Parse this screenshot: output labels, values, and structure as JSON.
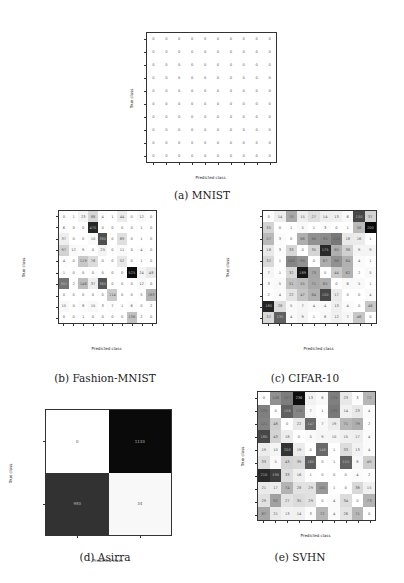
{
  "figure": {
    "captions": {
      "a": "(a) MNIST",
      "b": "(b) Fashion-MNIST",
      "c": "(c) CIFAR-10",
      "d": "(d) Asirra",
      "e": "(e) SVHN"
    }
  },
  "chart_data": [
    {
      "id": "mnist",
      "type": "heatmap",
      "title": "(a) MNIST",
      "xlabel": "Predicted class",
      "ylabel": "True class",
      "x_categories": [
        "0",
        "1",
        "2",
        "3",
        "4",
        "5",
        "6",
        "7",
        "8",
        "9"
      ],
      "y_categories": [
        "0",
        "1",
        "2",
        "3",
        "4",
        "5",
        "6",
        "7",
        "8",
        "9"
      ],
      "values": [
        [
          0,
          0,
          0,
          0,
          0,
          0,
          0,
          0,
          0,
          0
        ],
        [
          0,
          0,
          0,
          0,
          0,
          0,
          0,
          0,
          0,
          0
        ],
        [
          0,
          0,
          0,
          0,
          0,
          0,
          0,
          0,
          0,
          0
        ],
        [
          0,
          0,
          0,
          0,
          0,
          0,
          0,
          0,
          0,
          0
        ],
        [
          0,
          0,
          0,
          0,
          0,
          0,
          0,
          0,
          0,
          0
        ],
        [
          0,
          0,
          0,
          0,
          0,
          0,
          0,
          0,
          0,
          0
        ],
        [
          0,
          0,
          0,
          0,
          0,
          0,
          0,
          0,
          0,
          0
        ],
        [
          0,
          0,
          0,
          0,
          0,
          0,
          0,
          0,
          0,
          0
        ],
        [
          0,
          0,
          0,
          0,
          0,
          0,
          0,
          0,
          0,
          0
        ],
        [
          0,
          0,
          0,
          0,
          0,
          0,
          0,
          0,
          0,
          0
        ]
      ],
      "colormap": "greys",
      "vmax": 1
    },
    {
      "id": "fashion_mnist",
      "type": "heatmap",
      "title": "(b) Fashion-MNIST",
      "xlabel": "Predicted class",
      "ylabel": "True class",
      "x_categories": [
        "T-shirt/top",
        "trouser",
        "pullover",
        "dress",
        "coat",
        "sandal",
        "shirt",
        "sneaker",
        "bag",
        "ankle boot"
      ],
      "y_categories": [
        "T-shirt/top",
        "trouser",
        "pullover",
        "dress",
        "coat",
        "sandal",
        "shirt",
        "sneaker",
        "bag",
        "ankle boot"
      ],
      "values": [
        [
          0,
          1,
          23,
          88,
          4,
          1,
          44,
          0,
          12,
          0
        ],
        [
          6,
          0,
          0,
          470,
          0,
          0,
          0,
          0,
          1,
          0
        ],
        [
          37,
          0,
          0,
          10,
          380,
          0,
          69,
          0,
          1,
          0
        ],
        [
          97,
          12,
          9,
          0,
          25,
          0,
          11,
          0,
          4,
          0
        ],
        [
          4,
          0,
          119,
          76,
          0,
          0,
          52,
          0,
          1,
          0
        ],
        [
          1,
          0,
          0,
          0,
          0,
          0,
          0,
          525,
          24,
          48
        ],
        [
          301,
          2,
          146,
          37,
          365,
          0,
          0,
          0,
          12,
          0
        ],
        [
          0,
          0,
          0,
          0,
          0,
          114,
          0,
          0,
          5,
          163
        ],
        [
          15,
          0,
          8,
          15,
          3,
          7,
          1,
          6,
          0,
          2
        ],
        [
          0,
          0,
          1,
          0,
          0,
          0,
          0,
          136,
          2,
          0
        ]
      ],
      "colormap": "greys",
      "vmax": 530
    },
    {
      "id": "cifar10",
      "type": "heatmap",
      "title": "(c) CIFAR-10",
      "xlabel": "Predicted class",
      "ylabel": "True class",
      "x_categories": [
        "airplane",
        "automobile",
        "bird",
        "cat",
        "deer",
        "dog",
        "frog",
        "horse",
        "ship",
        "truck"
      ],
      "y_categories": [
        "airplane",
        "automobile",
        "bird",
        "cat",
        "deer",
        "dog",
        "frog",
        "horse",
        "ship",
        "truck"
      ],
      "values": [
        [
          0,
          14,
          70,
          15,
          27,
          14,
          13,
          6,
          150,
          37
        ],
        [
          35,
          0,
          1,
          5,
          1,
          3,
          0,
          1,
          56,
          200
        ],
        [
          57,
          3,
          0,
          66,
          90,
          95,
          110,
          18,
          16,
          1
        ],
        [
          18,
          3,
          33,
          0,
          35,
          175,
          65,
          38,
          9,
          9
        ],
        [
          32,
          1,
          100,
          90,
          0,
          67,
          90,
          64,
          4,
          1
        ],
        [
          7,
          1,
          32,
          189,
          73,
          0,
          44,
          62,
          2,
          5
        ],
        [
          3,
          5,
          51,
          55,
          71,
          65,
          0,
          6,
          5,
          1
        ],
        [
          2,
          4,
          22,
          47,
          64,
          150,
          17,
          0,
          0,
          4
        ],
        [
          180,
          28,
          5,
          7,
          4,
          4,
          13,
          4,
          0,
          46
        ],
        [
          32,
          130,
          4,
          9,
          1,
          6,
          12,
          7,
          46,
          0
        ]
      ],
      "colormap": "greys",
      "vmax": 200
    },
    {
      "id": "asirra",
      "type": "heatmap",
      "title": "(d) Asirra",
      "xlabel": "Predicted class",
      "ylabel": "True class",
      "x_categories": [
        "cat",
        "dog"
      ],
      "y_categories": [
        "cat",
        "dog"
      ],
      "values": [
        [
          0,
          1133
        ],
        [
          950,
          34
        ]
      ],
      "colormap": "greys",
      "vmax": 1133
    },
    {
      "id": "svhn",
      "type": "heatmap",
      "title": "(e) SVHN",
      "xlabel": "Predicted class",
      "ylabel": "True class",
      "x_categories": [
        "0",
        "1",
        "2",
        "3",
        "4",
        "5",
        "6",
        "7",
        "8",
        "9"
      ],
      "y_categories": [
        "0",
        "1",
        "2",
        "3",
        "4",
        "5",
        "6",
        "7",
        "8",
        "9"
      ],
      "values": [
        [
          0,
          108,
          127,
          236,
          13,
          6,
          125,
          23,
          3,
          72
        ],
        [
          125,
          0,
          156,
          120,
          7,
          1,
          131,
          14,
          23,
          4
        ],
        [
          121,
          48,
          0,
          22,
          147,
          7,
          19,
          71,
          79,
          2
        ],
        [
          180,
          43,
          18,
          0,
          5,
          9,
          10,
          15,
          17,
          4
        ],
        [
          19,
          10,
          200,
          19,
          0,
          148,
          1,
          33,
          13,
          4
        ],
        [
          33,
          5,
          43,
          39,
          160,
          0,
          1,
          155,
          8,
          49
        ],
        [
          210,
          190,
          33,
          16,
          1,
          0,
          0,
          0,
          4,
          2
        ],
        [
          21,
          17,
          74,
          28,
          29,
          101,
          1,
          0,
          38,
          15
        ],
        [
          29,
          92,
          27,
          35,
          29,
          0,
          4,
          34,
          0,
          73
        ],
        [
          87,
          21,
          13,
          14,
          3,
          72,
          4,
          26,
          71,
          0
        ]
      ],
      "colormap": "greys",
      "vmax": 240
    }
  ]
}
